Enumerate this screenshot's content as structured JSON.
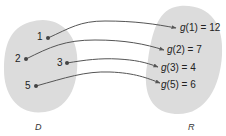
{
  "diagram": {
    "type": "function-mapping",
    "domain_set": {
      "label": "D",
      "elements": [
        "1",
        "2",
        "3",
        "5"
      ]
    },
    "range_set": {
      "label": "R",
      "elements": [
        "g(1) = 12",
        "g(2) = 7",
        "g(3) = 4",
        "g(5) = 6"
      ]
    },
    "mappings": [
      {
        "from": "1",
        "to": "g(1) = 12"
      },
      {
        "from": "2",
        "to": "g(2) = 7"
      },
      {
        "from": "3",
        "to": "g(3) = 4"
      },
      {
        "from": "5",
        "to": "g(5) = 6"
      }
    ],
    "colors": {
      "set_fill": "#dcdcdc",
      "arrow": "#555555",
      "dot": "#444444"
    }
  },
  "labels": {
    "d1": "1",
    "d2": "2",
    "d3": "3",
    "d5": "5",
    "g1_fn": "g",
    "g1_rest": "(1) = 12",
    "g2_fn": "g",
    "g2_rest": "(2) = 7",
    "g3_fn": "g",
    "g3_rest": "(3) = 4",
    "g5_fn": "g",
    "g5_rest": "(5) = 6",
    "D": "D",
    "R": "R"
  }
}
